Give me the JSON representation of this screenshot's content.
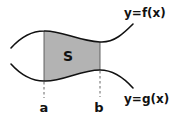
{
  "diagram": {
    "region": {
      "label": "S",
      "fill_color": "#b3b3b3"
    },
    "upper_curve": {
      "label": "y=f(x)"
    },
    "lower_curve": {
      "label": "y=g(x)"
    },
    "bounds": {
      "left_label": "a",
      "right_label": "b"
    },
    "colors": {
      "curve": "#111111",
      "region": "#b3b3b3",
      "guide": "#555555",
      "background": "#ffffff"
    }
  }
}
